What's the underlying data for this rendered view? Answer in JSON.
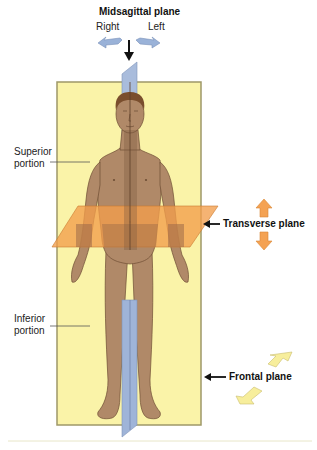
{
  "diagram": {
    "labels": {
      "midsagittal": "Midsagittal plane",
      "right": "Right",
      "left": "Left",
      "superior_line1": "Superior",
      "superior_line2": "portion",
      "inferior_line1": "Inferior",
      "inferior_line2": "portion",
      "transverse": "Transverse plane",
      "frontal": "Frontal plane"
    },
    "colors": {
      "frontal_plane_fill": "#FAF3A8",
      "frontal_plane_border": "#9E9868",
      "midsagittal_plane_fill": "#9FB4D8",
      "transverse_plane_fill": "#F29E4C",
      "skin": "#B08968",
      "hair": "#7A4E2D",
      "arrow_blue": "#9AB2D8",
      "arrow_orange": "#F4A253",
      "arrow_yellow": "#F7EE9C",
      "footer_rule": "#E8E6C8"
    }
  }
}
